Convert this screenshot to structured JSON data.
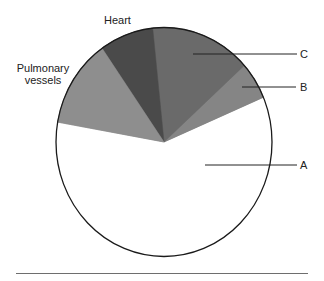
{
  "chart_data": {
    "type": "pie",
    "title": "",
    "slices": [
      {
        "label": "A",
        "value": 59,
        "color": "#7a7a7a",
        "start_deg": -170,
        "end_deg": -23
      },
      {
        "label": "B",
        "value": 5,
        "color": "#858585",
        "start_deg": -23,
        "end_deg": -42
      },
      {
        "label": "C",
        "value": 15,
        "color": "#6a6a6a",
        "start_deg": -42,
        "end_deg": -96
      },
      {
        "label": "Heart",
        "value": 8,
        "color": "#4a4a4a",
        "start_deg": -96,
        "end_deg": -125
      },
      {
        "label": "Pulmonary vessels",
        "value": 13,
        "color": "#8e8e8e",
        "start_deg": -125,
        "end_deg": -170
      }
    ],
    "categories": [
      "A",
      "B",
      "C",
      "Heart",
      "Pulmonary vessels"
    ],
    "values": [
      59,
      5,
      15,
      8,
      13
    ],
    "legend": "none (direct labels with leader lines)",
    "units": "percent (estimated from slice angles)"
  },
  "labels": {
    "heart": "Heart",
    "pulmonary_line1": "Pulmonary",
    "pulmonary_line2": "vessels",
    "a": "A",
    "b": "B",
    "c": "C"
  },
  "style": {
    "outline_color": "#1a1a1a",
    "leader_color": "#222222",
    "separator_color": "#6e6e6e"
  }
}
